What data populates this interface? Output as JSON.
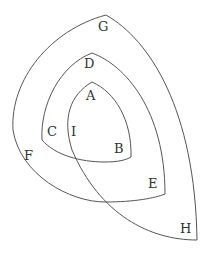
{
  "diagram": {
    "type": "nested curves / spiral region diagram",
    "labels": {
      "G": "G",
      "D": "D",
      "A": "A",
      "C": "C",
      "I": "I",
      "B": "B",
      "F": "F",
      "E": "E",
      "H": "H"
    },
    "colors": {
      "stroke": "#555555",
      "text": "#333333",
      "background": "#ffffff"
    }
  }
}
